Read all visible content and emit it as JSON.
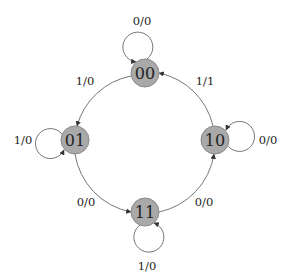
{
  "diagram": {
    "type": "state-transition",
    "colors": {
      "node_fill": "#a9a9a9",
      "node_stroke": "#8a8a8a",
      "edge": "#666666",
      "text": "#222222"
    },
    "nodes": [
      {
        "id": "00",
        "label": "00",
        "x": 145,
        "y": 73
      },
      {
        "id": "01",
        "label": "01",
        "x": 75,
        "y": 140
      },
      {
        "id": "11",
        "label": "11",
        "x": 145,
        "y": 212
      },
      {
        "id": "10",
        "label": "10",
        "x": 215,
        "y": 140
      }
    ],
    "edges": [
      {
        "from": "00",
        "to": "00",
        "label": "0/0"
      },
      {
        "from": "00",
        "to": "01",
        "label": "1/0"
      },
      {
        "from": "01",
        "to": "01",
        "label": "1/0"
      },
      {
        "from": "01",
        "to": "11",
        "label": "0/0"
      },
      {
        "from": "11",
        "to": "11",
        "label": "1/0"
      },
      {
        "from": "11",
        "to": "10",
        "label": "0/0"
      },
      {
        "from": "10",
        "to": "10",
        "label": "0/0"
      },
      {
        "from": "10",
        "to": "00",
        "label": "1/1"
      }
    ]
  }
}
